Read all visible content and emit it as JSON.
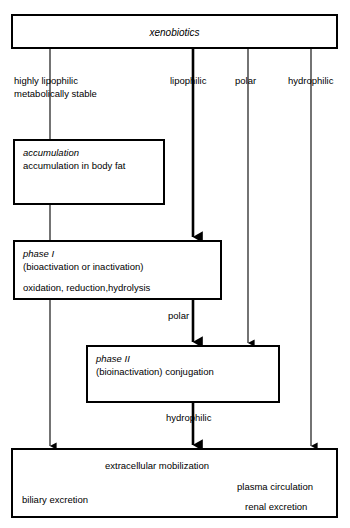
{
  "diagram": {
    "top_box": {
      "label": "xenobiotics"
    },
    "branch_labels": {
      "highly_lipophilic_line1": "highly lipophilic",
      "highly_lipophilic_line2": "metabolically stable",
      "lipophilic": "lipophilic",
      "polar": "polar",
      "hydrophilic": "hydrophilic"
    },
    "accumulation_box": {
      "heading": "accumulation",
      "line1": "accumulation in body fat"
    },
    "phase_i_box": {
      "heading": "phase I",
      "line1": "(bioactivation or inactivation)",
      "line2": "oxidation, reduction,hydrolysis"
    },
    "phase_ii_box": {
      "heading": "phase II",
      "line1": "(bioinactivation) conjugation"
    },
    "edge_labels": {
      "polar_mid": "polar",
      "hydrophilic_mid": "hydrophilic"
    },
    "excretion_box": {
      "main": "extracellular mobilization",
      "biliary": "biliary excretion",
      "plasma": "plasma circulation",
      "renal": "renal excretion"
    },
    "colors": {
      "stroke": "#000000",
      "background": "#ffffff",
      "text": "#000000"
    }
  }
}
